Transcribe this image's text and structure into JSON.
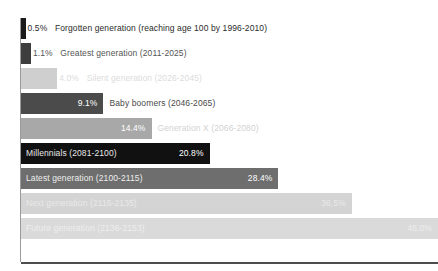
{
  "chart_data": {
    "type": "bar",
    "orientation": "horizontal",
    "title": "",
    "subtitle": "",
    "xlabel": "",
    "ylabel": "",
    "grid": false,
    "legend": "none",
    "xlim": [
      0,
      46.0
    ],
    "categories": [
      "Forgotten generation (reaching age 100 by 1996-2010)",
      "Greatest generation (2011-2025)",
      "Silent generation (2026-2045)",
      "Baby boomers (2046-2065)",
      "Generation X (2066-2080)",
      "Millennials (2081-2100)",
      "Latest generation (2100-2115)",
      "Next generation (2116-2135)",
      "Future generation (2136-2153)"
    ],
    "values": [
      0.5,
      1.1,
      4.0,
      9.1,
      14.4,
      20.8,
      28.4,
      36.5,
      46.0
    ],
    "value_labels": [
      "0.5%",
      "1.1%",
      "4.0%",
      "9.1%",
      "14.4%",
      "20.8%",
      "28.4%",
      "36.5%",
      "46.0%"
    ]
  },
  "bars": [
    {
      "label": "Forgotten generation (reaching age 100 by 1996-2010)",
      "value_label": "0.5%",
      "bar_color": "#1a1a1a",
      "value_color": "#2b2b2b",
      "label_color": "#2b2b2b",
      "value_placement": "outside",
      "label_placement": "outside"
    },
    {
      "label": "Greatest generation (2011-2025)",
      "value_label": "1.1%",
      "bar_color": "#3d3d3d",
      "value_color": "#555555",
      "label_color": "#555555",
      "value_placement": "outside",
      "label_placement": "outside"
    },
    {
      "label": "Silent generation (2026-2045)",
      "value_label": "4.0%",
      "bar_color": "#cfcfcf",
      "value_color": "#dcdcdc",
      "label_color": "#dcdcdc",
      "value_placement": "outside",
      "label_placement": "outside"
    },
    {
      "label": "Baby boomers (2046-2065)",
      "value_label": "9.1%",
      "bar_color": "#4b4b4b",
      "value_color": "#ffffff",
      "label_color": "#4a4a4a",
      "value_placement": "inside-right",
      "label_placement": "outside"
    },
    {
      "label": "Generation X (2066-2080)",
      "value_label": "14.4%",
      "bar_color": "#a8a8a8",
      "value_color": "#ffffff",
      "label_color": "#d2d2d2",
      "value_placement": "inside-right",
      "label_placement": "outside"
    },
    {
      "label": "Millennials (2081-2100)",
      "value_label": "20.8%",
      "bar_color": "#111111",
      "value_color": "#ffffff",
      "label_color": "#e8e8e8",
      "value_placement": "inside-right",
      "label_placement": "inside-left"
    },
    {
      "label": "Latest generation (2100-2115)",
      "value_label": "28.4%",
      "bar_color": "#6e6e6e",
      "value_color": "#ffffff",
      "label_color": "#ededed",
      "value_placement": "inside-right",
      "label_placement": "inside-left"
    },
    {
      "label": "Next generation (2116-2135)",
      "value_label": "36.5%",
      "bar_color": "#d4d4d4",
      "value_color": "#e9e9e9",
      "label_color": "#e9e9e9",
      "value_placement": "inside-right",
      "label_placement": "inside-left"
    },
    {
      "label": "Future generation (2136-2153)",
      "value_label": "46.0%",
      "bar_color": "#dadada",
      "value_color": "#eeeeee",
      "label_color": "#eeeeee",
      "value_placement": "inside-right",
      "label_placement": "inside-left"
    }
  ],
  "axes": {
    "x_axis_color": "#4d4d4d",
    "y_axis_color": "#9a9a9a"
  },
  "layout": {
    "bar_start_x": 21,
    "first_bar_top": 18,
    "row_pitch": 25,
    "bar_height": 21,
    "max_bar_end_x": 438,
    "x_axis_y": 262
  }
}
